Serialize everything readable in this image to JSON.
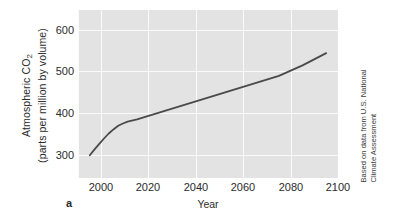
{
  "figure": {
    "panel_letter": "a",
    "credit_line_1": "Based on data from U.S. National",
    "credit_line_2": "Climate Assessment",
    "plot_background_color": "#e3e3e3",
    "gridline_color": "#fbfbfb",
    "series_color": "#4a4a4a"
  },
  "axis": {
    "ylabel_line_1_prefix": "Atmospheric CO",
    "ylabel_line_1_subscript": "2",
    "ylabel_line_2": "(parts per million by volume)",
    "xlabel": "Year",
    "yticks": [
      "300",
      "400",
      "500",
      "600"
    ],
    "xticks": [
      "2000",
      "2020",
      "2040",
      "2060",
      "2080",
      "2100"
    ]
  },
  "chart_data": {
    "type": "line",
    "title": "",
    "xlabel": "Year",
    "ylabel": "Atmospheric CO2 (parts per million by volume)",
    "xlim": [
      1995,
      2105
    ],
    "ylim": [
      275,
      645
    ],
    "xticks": [
      2000,
      2020,
      2040,
      2060,
      2080,
      2100
    ],
    "yticks": [
      300,
      400,
      500,
      600
    ],
    "grid": true,
    "legend": "none",
    "annotations": [
      "a",
      "Based on data from U.S. National Climate Assessment"
    ],
    "series": [
      {
        "name": "Atmospheric CO2",
        "x": [
          2000,
          2002,
          2004,
          2006,
          2008,
          2010,
          2012,
          2014,
          2016,
          2020,
          2030,
          2040,
          2050,
          2060,
          2070,
          2080,
          2090,
          2100
        ],
        "values": [
          325,
          338,
          350,
          362,
          373,
          382,
          390,
          395,
          399,
          404,
          420,
          436,
          452,
          468,
          484,
          500,
          523,
          550
        ]
      }
    ]
  }
}
